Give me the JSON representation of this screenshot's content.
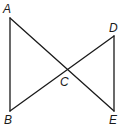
{
  "diagram": {
    "type": "geometry",
    "points": {
      "A": {
        "label": "A",
        "x": 10,
        "y": 18,
        "label_x": 3,
        "label_y": 13
      },
      "B": {
        "label": "B",
        "x": 10,
        "y": 111,
        "label_x": 4,
        "label_y": 124
      },
      "C": {
        "label": "C",
        "x": 67,
        "y": 70,
        "label_x": 60,
        "label_y": 86
      },
      "D": {
        "label": "D",
        "x": 114,
        "y": 36,
        "label_x": 109,
        "label_y": 32
      },
      "E": {
        "label": "E",
        "x": 114,
        "y": 111,
        "label_x": 109,
        "label_y": 124
      }
    },
    "segments": [
      {
        "from": "A",
        "to": "B"
      },
      {
        "from": "A",
        "to": "E"
      },
      {
        "from": "B",
        "to": "D"
      },
      {
        "from": "D",
        "to": "E"
      }
    ],
    "colors": {
      "line": "#1a1a1a",
      "background": "#ffffff"
    }
  }
}
